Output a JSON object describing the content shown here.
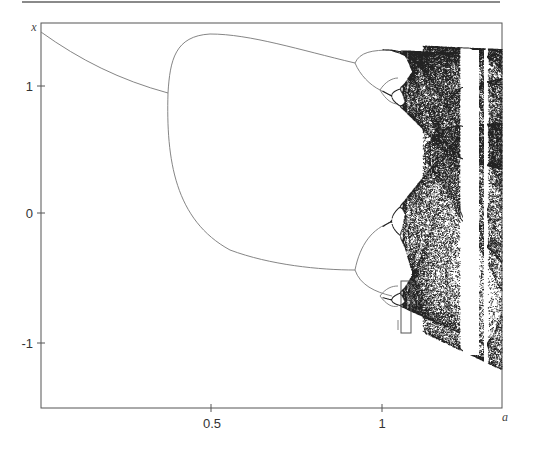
{
  "chart_data": {
    "type": "scatter",
    "title": "",
    "xlabel": "a",
    "ylabel": "x",
    "xlim": [
      0,
      1.35
    ],
    "ylim": [
      -1.52,
      1.48
    ],
    "grid": false,
    "legend": null,
    "x_ticks": [
      0.5,
      1
    ],
    "x_tick_labels": [
      "0.5",
      "1"
    ],
    "y_ticks": [
      1,
      0,
      -1
    ],
    "y_tick_labels": [
      "1",
      "0",
      "-1"
    ],
    "features": {
      "fixed_point_branch": {
        "a_start": 0.0,
        "x_start": 1.39,
        "a_end": 0.37,
        "x_end": 0.96
      },
      "period2_onset_a": 0.37,
      "period2_upper_max": 1.4,
      "period4_onset_a": 0.91,
      "chaos_onset_a": 1.06,
      "period7_window_a": [
        1.22,
        1.26
      ],
      "period3_window_a": [
        1.27,
        1.29
      ],
      "annotation_box": {
        "a": [
          1.06,
          1.08
        ],
        "x": [
          -0.53,
          -0.94
        ]
      }
    }
  },
  "labels": {
    "x_axis_var": "a",
    "y_axis_var": "x",
    "y_ticks": [
      "1",
      "0",
      "-1"
    ],
    "x_ticks": [
      "0.5",
      "1"
    ]
  }
}
